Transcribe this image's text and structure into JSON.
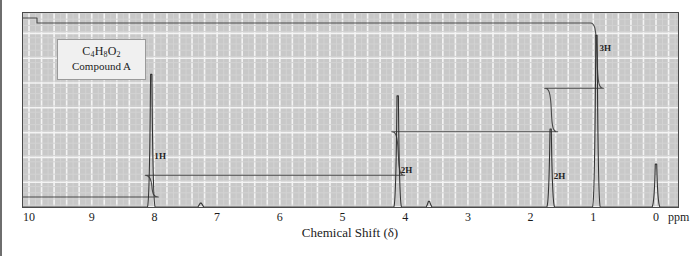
{
  "figure": {
    "sample_label": {
      "formula_parts": [
        "C",
        "4",
        "H",
        "8",
        "O",
        "2"
      ],
      "formula_text": "C4H8O2",
      "compound_name": "Compound A"
    },
    "axis": {
      "title": "Chemical Shift (δ)",
      "unit_label": "ppm",
      "tick_labels": [
        "10",
        "9",
        "8",
        "7",
        "6",
        "5",
        "4",
        "3",
        "2",
        "1",
        "0"
      ],
      "tick_values": [
        10,
        9,
        8,
        7,
        6,
        5,
        4,
        3,
        2,
        1,
        0
      ],
      "direction": "decreasing-left-to-right"
    },
    "peak_labels": [
      {
        "text": "1H",
        "shift": 8.05
      },
      {
        "text": "2H",
        "shift": 4.12
      },
      {
        "text": "2H",
        "shift": 1.68
      },
      {
        "text": "3H",
        "shift": 0.95
      }
    ],
    "colors": {
      "plot_background": "#c8c8c8",
      "grid_major": "#f2f2f2",
      "grid_minor": "#d6d6d6",
      "trace": "#3a3a3a",
      "integral": "#4a4a4a",
      "frame": "#4a4a4a",
      "text": "#1b1b1b"
    }
  },
  "chart_data": {
    "type": "line",
    "title": "",
    "subtitle": "",
    "xlabel": "Chemical Shift (δ)",
    "ylabel": "",
    "xlim": [
      10,
      0
    ],
    "ylim": [
      0,
      100
    ],
    "grid": true,
    "legend": "none",
    "x_unit": "ppm",
    "annotations": [
      {
        "text": "C4H8O2",
        "x": 9.1,
        "y": 92
      },
      {
        "text": "Compound A",
        "x": 9.1,
        "y": 86
      }
    ],
    "series": [
      {
        "name": "1H NMR spectrum",
        "type": "peaks",
        "peaks": [
          {
            "shift": 8.05,
            "height": 68,
            "integration": "1H",
            "multiplicity": "singlet",
            "assignment": "CHO",
            "label": "1H"
          },
          {
            "shift": 7.26,
            "height": 2,
            "integration": "",
            "multiplicity": "singlet",
            "assignment": "solvent",
            "label": ""
          },
          {
            "shift": 4.12,
            "height": 57,
            "integration": "2H",
            "multiplicity": "triplet",
            "assignment": "OCH2",
            "label": "2H"
          },
          {
            "shift": 3.62,
            "height": 3,
            "integration": "",
            "multiplicity": "singlet",
            "assignment": "impurity",
            "label": ""
          },
          {
            "shift": 1.68,
            "height": 40,
            "integration": "2H",
            "multiplicity": "sextet",
            "assignment": "CH2",
            "label": "2H"
          },
          {
            "shift": 0.95,
            "height": 88,
            "integration": "3H",
            "multiplicity": "triplet",
            "assignment": "CH3",
            "label": "3H"
          },
          {
            "shift": 0.0,
            "height": 22,
            "integration": "",
            "multiplicity": "singlet",
            "assignment": "TMS",
            "label": ""
          }
        ]
      },
      {
        "name": "integration trace",
        "type": "step",
        "steps": [
          {
            "shift": 8.05,
            "rise": 1,
            "plateau_after": 1
          },
          {
            "shift": 4.12,
            "rise": 2,
            "plateau_after": 3
          },
          {
            "shift": 1.68,
            "rise": 2,
            "plateau_after": 5
          },
          {
            "shift": 0.95,
            "rise": 3,
            "plateau_after": 8
          }
        ],
        "total_protons": 8
      }
    ]
  }
}
